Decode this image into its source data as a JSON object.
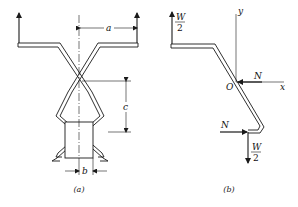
{
  "figure_a": {
    "caption": "(a)",
    "dimensions": {
      "a": "a",
      "b": "b",
      "c": "c"
    }
  },
  "figure_b": {
    "caption": "(b)",
    "axes": {
      "x": "x",
      "y": "y",
      "origin": "O"
    },
    "forces": {
      "top_load_num": "W",
      "top_load_den": "2",
      "normal_top": "N",
      "normal_bottom": "N",
      "bottom_load_num": "W",
      "bottom_load_den": "2"
    }
  },
  "colors": {
    "line": "#1a1a1a",
    "background": "#ffffff"
  }
}
